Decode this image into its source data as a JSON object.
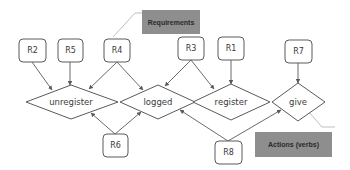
{
  "diagram": {
    "requirements": [
      {
        "id": "R2",
        "label": "R2"
      },
      {
        "id": "R5",
        "label": "R5"
      },
      {
        "id": "R4",
        "label": "R4"
      },
      {
        "id": "R3",
        "label": "R3"
      },
      {
        "id": "R1",
        "label": "R1"
      },
      {
        "id": "R7",
        "label": "R7"
      },
      {
        "id": "R6",
        "label": "R6"
      },
      {
        "id": "R8",
        "label": "R8"
      }
    ],
    "actions": [
      {
        "id": "unregister",
        "label": "unregister"
      },
      {
        "id": "logged",
        "label": "logged"
      },
      {
        "id": "register",
        "label": "register"
      },
      {
        "id": "give",
        "label": "give"
      }
    ],
    "edges": [
      {
        "from": "R2",
        "to": "unregister"
      },
      {
        "from": "R5",
        "to": "unregister"
      },
      {
        "from": "R4",
        "to": "unregister"
      },
      {
        "from": "R4",
        "to": "logged"
      },
      {
        "from": "R3",
        "to": "logged"
      },
      {
        "from": "R3",
        "to": "register"
      },
      {
        "from": "R1",
        "to": "register"
      },
      {
        "from": "R7",
        "to": "give"
      },
      {
        "from": "R6",
        "to": "unregister"
      },
      {
        "from": "R6",
        "to": "logged"
      },
      {
        "from": "R8",
        "to": "logged"
      },
      {
        "from": "R8",
        "to": "give"
      }
    ],
    "callouts": {
      "requirements": "Requirements",
      "actions": "Actions (verbs)"
    },
    "colors": {
      "stroke": "#5a5a5a",
      "callout_fill": "#8e8e8e",
      "callout_line": "#b8b8b8"
    }
  }
}
